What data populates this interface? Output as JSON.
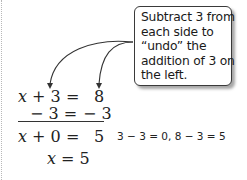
{
  "callout": {
    "lines": [
      "Subtract 3 from",
      "each side to",
      "“undo” the",
      "addition of 3 on",
      "the left."
    ]
  },
  "equations": {
    "row1": {
      "var": "x",
      "lhs_rest": " + 3 =",
      "rhs": "8"
    },
    "row2": {
      "lhs": "− 3 =",
      "rhs": "− 3"
    },
    "row3": {
      "var": "x",
      "lhs_rest": " + 0 =",
      "rhs": "5"
    },
    "row4": {
      "var": "x",
      "rest": " = 5"
    }
  },
  "note": "3 − 3 = 0, 8 − 3 = 5",
  "colors": {
    "ink": "#222222",
    "box_border": "#3a3a3a",
    "shadow": "#8a8a8a"
  }
}
